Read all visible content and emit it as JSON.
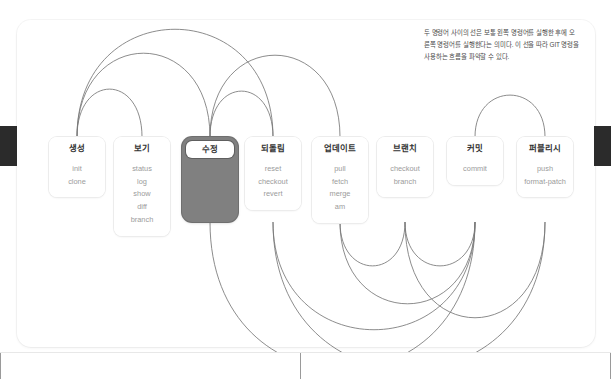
{
  "note": {
    "text": "두 명령어 사이의 선은 보통 왼쪽 명령어를 실행한 후에 오른쪽 명령어를 실행한다는 의미다. 이 선을 따라 GIT 명령을 사용하는 흐름을 파악할 수 있다."
  },
  "colors": {
    "highlight_fill": "#808080",
    "box_border": "#ececec",
    "arc_stroke": "#777777",
    "header_text": "#333333",
    "body_text": "#9b9b9b",
    "edge_tab": "#2b2b2b"
  },
  "diagram": {
    "type": "arc-flow",
    "boxes": [
      {
        "id": "create",
        "title": "생성",
        "cx": 77,
        "commands": [
          "init",
          "clone"
        ],
        "highlighted": false
      },
      {
        "id": "view",
        "title": "보기",
        "cx": 142,
        "commands": [
          "status",
          "log",
          "show",
          "diff",
          "branch"
        ],
        "highlighted": false
      },
      {
        "id": "modify",
        "title": "수정",
        "cx": 210,
        "commands": [],
        "highlighted": true
      },
      {
        "id": "revert",
        "title": "되돌림",
        "cx": 273,
        "commands": [
          "reset",
          "checkout",
          "revert"
        ],
        "highlighted": false
      },
      {
        "id": "update",
        "title": "업데이트",
        "cx": 340,
        "commands": [
          "pull",
          "fetch",
          "merge",
          "am"
        ],
        "highlighted": false
      },
      {
        "id": "branch",
        "title": "브랜치",
        "cx": 405,
        "commands": [
          "checkout",
          "branch"
        ],
        "highlighted": false
      },
      {
        "id": "commit",
        "title": "커밋",
        "cx": 475,
        "commands": [
          "commit"
        ],
        "highlighted": false
      },
      {
        "id": "publish",
        "title": "퍼블리시",
        "cx": 545,
        "commands": [
          "push",
          "format-patch"
        ],
        "highlighted": false
      }
    ],
    "arcs_top": [
      {
        "from": 77,
        "to": 142,
        "h": 48
      },
      {
        "from": 77,
        "to": 210,
        "h": 84
      },
      {
        "from": 77,
        "to": 273,
        "h": 108
      },
      {
        "from": 210,
        "to": 273,
        "h": 46
      },
      {
        "from": 210,
        "to": 340,
        "h": 82
      },
      {
        "from": 475,
        "to": 545,
        "h": 42
      }
    ],
    "arcs_bottom": [
      {
        "from": 210,
        "to": 475,
        "h": 148
      },
      {
        "from": 273,
        "to": 475,
        "h": 108
      },
      {
        "from": 340,
        "to": 405,
        "h": 44
      },
      {
        "from": 340,
        "to": 475,
        "h": 82
      },
      {
        "from": 405,
        "to": 475,
        "h": 44
      },
      {
        "from": 405,
        "to": 545,
        "h": 96
      },
      {
        "from": 273,
        "to": 545,
        "h": 148
      }
    ]
  },
  "bottom_strip": {
    "dividers": [
      0,
      300,
      610
    ]
  }
}
